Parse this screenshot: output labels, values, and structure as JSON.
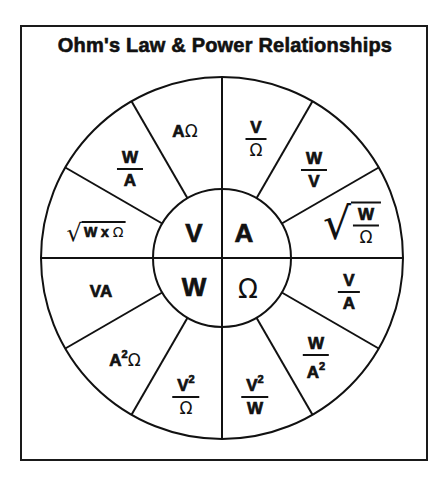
{
  "title": "Ohm's Law & Power Relationships",
  "colors": {
    "ink": "#111111",
    "background": "#ffffff"
  },
  "center": {
    "top_left": "V",
    "top_right": "A",
    "bottom_left": "W",
    "bottom_right": "Ω"
  },
  "sectors": [
    {
      "id": "v-over-ohm",
      "quadrant": "A",
      "num": "V",
      "den": "Ω"
    },
    {
      "id": "w-over-v",
      "quadrant": "A",
      "num": "W",
      "den": "V"
    },
    {
      "id": "sqrt-w-over-ohm",
      "quadrant": "A",
      "sqrt": true,
      "num": "W",
      "den": "Ω"
    },
    {
      "id": "v-over-a",
      "quadrant": "Ω",
      "num": "V",
      "den": "A"
    },
    {
      "id": "w-over-a-squared",
      "quadrant": "Ω",
      "num": "W",
      "den": "A",
      "den_sup": "2"
    },
    {
      "id": "v-squared-over-w",
      "quadrant": "W",
      "num": "V",
      "num_sup": "2",
      "den": "W"
    },
    {
      "id": "v-squared-over-ohm",
      "quadrant": "W",
      "num": "V",
      "num_sup": "2",
      "den": "Ω"
    },
    {
      "id": "a-squared-ohm",
      "quadrant": "W",
      "base": "A",
      "sup": "2",
      "tail": "Ω"
    },
    {
      "id": "va",
      "quadrant": "W",
      "text": "VA"
    },
    {
      "id": "sqrt-w-times-ohm",
      "quadrant": "V",
      "sqrt": true,
      "a": "W",
      "op": "x",
      "b": "Ω"
    },
    {
      "id": "w-over-a",
      "quadrant": "V",
      "num": "W",
      "den": "A"
    },
    {
      "id": "a-ohm",
      "quadrant": "V",
      "a": "A",
      "b": "Ω"
    }
  ]
}
